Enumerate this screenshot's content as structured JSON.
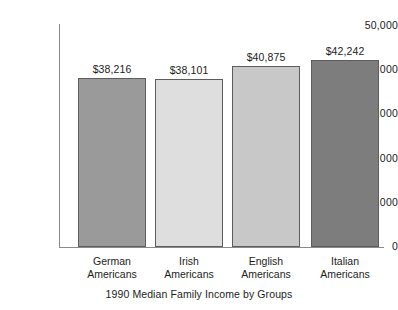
{
  "chart_data": {
    "type": "bar",
    "title": "",
    "caption": "1990 Median Family Income by Groups",
    "xlabel": "",
    "ylabel": "",
    "ylim": [
      0,
      50000
    ],
    "grid": false,
    "legend": "none",
    "categories": [
      "German Americans",
      "Irish Americans",
      "English Americans",
      "Italian Americans"
    ],
    "category_lines": [
      [
        "German",
        "Americans"
      ],
      [
        "Irish",
        "Americans"
      ],
      [
        "English",
        "Americans"
      ],
      [
        "Italian",
        "Americans"
      ]
    ],
    "values": [
      38216,
      38101,
      40875,
      42242
    ],
    "value_labels": [
      "$38,216",
      "$38,101",
      "$40,875",
      "$42,242"
    ],
    "bar_colors": [
      "#9a9a9a",
      "#dedede",
      "#c8c8c8",
      "#7d7d7d"
    ],
    "bar_border_color": "#5d5d5d",
    "axis_color": "#8a8a8a",
    "text_color": "#1c1c1c",
    "y_ticks": [
      50000,
      40000,
      30000,
      20000,
      10000,
      0
    ],
    "y_tick_labels": [
      "50,000",
      "40,000",
      "30,000",
      "20,000",
      "10,000",
      "0"
    ]
  }
}
